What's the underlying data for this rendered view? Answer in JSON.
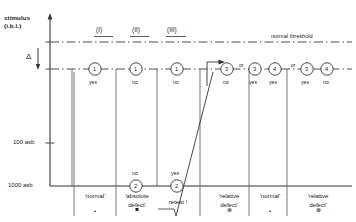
{
  "figure": {
    "axis": {
      "title_line1": "stimulus",
      "title_line2": "(i.b.l.)",
      "delta_symbol": "Δ",
      "ticks": [
        {
          "label": "100 asb",
          "y": 143
        },
        {
          "label": "1000 asb",
          "y": 186
        }
      ]
    },
    "threshold_line_label": "normal threshold",
    "stages": [
      {
        "label": "(I)",
        "x": 103
      },
      {
        "label": "(II)",
        "x": 139
      },
      {
        "label": "(III)",
        "x": 175
      }
    ],
    "or_labels": [
      {
        "text": "or",
        "x": 241
      },
      {
        "text": "or",
        "x": 293
      }
    ],
    "top_nodes": [
      {
        "number": "1",
        "answer": "yes",
        "x": 95
      },
      {
        "number": "1",
        "answer": "no",
        "x": 136
      },
      {
        "number": "1",
        "answer": "no",
        "x": 177
      },
      {
        "number": "3",
        "answer": "no",
        "x": 227
      },
      {
        "number": "3",
        "answer": "yes",
        "x": 255
      },
      {
        "number": "4",
        "answer": "yes",
        "x": 275
      },
      {
        "number": "3",
        "answer": "yes",
        "x": 307
      },
      {
        "number": "4",
        "answer": "no",
        "x": 327
      }
    ],
    "bottom_nodes": [
      {
        "number": "2",
        "answer": "no",
        "x": 136
      },
      {
        "number": "2",
        "answer": "yes",
        "x": 177
      }
    ],
    "verdicts": [
      {
        "line1": "'normal'",
        "line2": "",
        "symbol": "•",
        "symbol_kind": "dot",
        "x": 95
      },
      {
        "line1": "'absolute",
        "line2": "defect'",
        "symbol": "■",
        "symbol_kind": "filled-square",
        "x": 136
      },
      {
        "line1": "retest !",
        "line2": "",
        "symbol": "",
        "symbol_kind": "none",
        "x": 177
      },
      {
        "line1": "'relative",
        "line2": "defect'",
        "symbol": "⊗",
        "symbol_kind": "circled-x",
        "x": 228
      },
      {
        "line1": "'normal'",
        "line2": "",
        "symbol": "•",
        "symbol_kind": "dot",
        "x": 272
      },
      {
        "line1": "'relative",
        "line2": "defect'",
        "symbol": "⊗",
        "symbol_kind": "circled-x",
        "x": 317
      }
    ],
    "colors": {
      "ink": "#1a1a1a",
      "line": "#333333",
      "dashed": "#3a3a3a",
      "background": "#ffffff"
    }
  }
}
